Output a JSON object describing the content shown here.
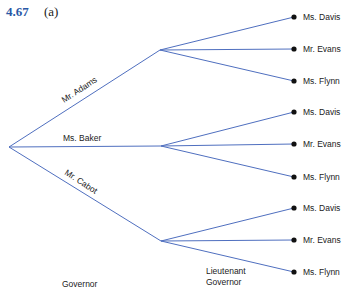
{
  "figure": {
    "number": "4.67",
    "sublabel": "(a)"
  },
  "tree": {
    "level1_title": "Governor",
    "level2_title_line1": "Lieutenant",
    "level2_title_line2": "Governor",
    "branches": [
      {
        "label": "Mr. Adams",
        "children": [
          "Ms. Davis",
          "Mr. Evans",
          "Ms. Flynn"
        ]
      },
      {
        "label": "Ms. Baker",
        "children": [
          "Ms. Davis",
          "Mr. Evans",
          "Ms. Flynn"
        ]
      },
      {
        "label": "Mr. Cabot",
        "children": [
          "Ms. Davis",
          "Mr. Evans",
          "Ms. Flynn"
        ]
      }
    ]
  },
  "colors": {
    "edge": "#4f6fbf",
    "figure_number": "#2a58a6",
    "leaf_dot": "#111111"
  }
}
